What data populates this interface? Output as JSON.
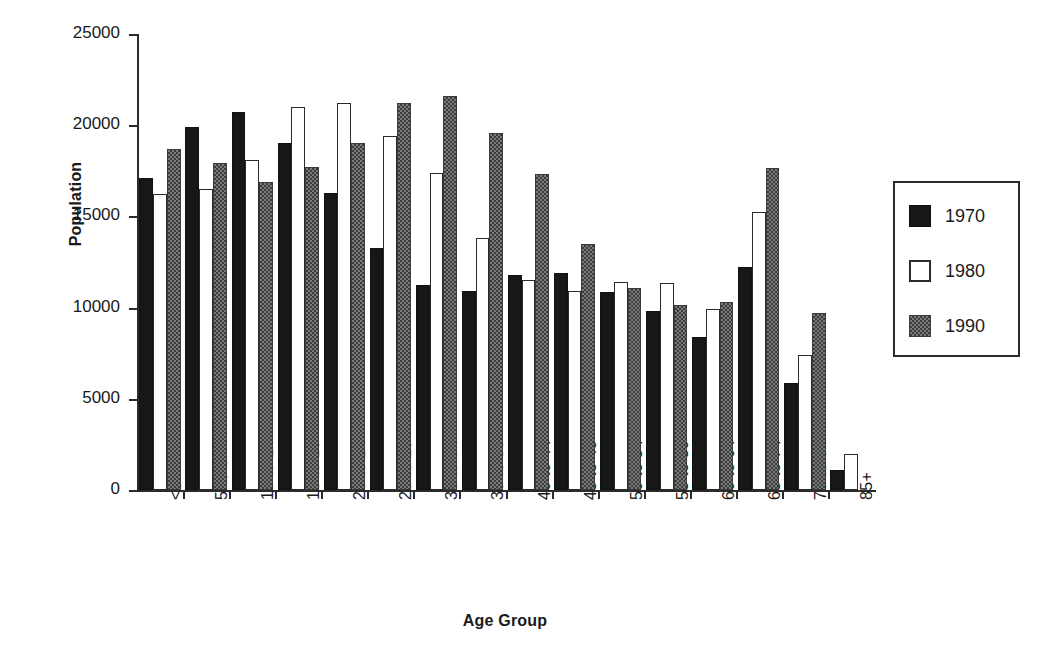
{
  "chart_data": {
    "type": "bar",
    "title": "",
    "xlabel": "Age Group",
    "ylabel": "Population",
    "ylim": [
      0,
      25000
    ],
    "ytick_values": [
      0,
      5000,
      10000,
      15000,
      20000,
      25000
    ],
    "ytick_labels": [
      "0",
      "5000",
      "10000",
      "15000",
      "20000",
      "25000"
    ],
    "grid": false,
    "legend_position": "right",
    "categories": [
      "<5",
      "5 to 9",
      "10 to 14",
      "15 to 19",
      "20 to 24",
      "25 to 29",
      "30 to 34",
      "35 to 39",
      "40 to 44",
      "45 to 49",
      "50 to 54",
      "55 to 59",
      "60 to 64",
      "65 to 74",
      "75 to 84",
      "85+"
    ],
    "series": [
      {
        "name": "1970",
        "color": "#171717",
        "values": [
          17100,
          19900,
          20700,
          19000,
          16300,
          13250,
          11250,
          10900,
          11800,
          11900,
          10850,
          9800,
          8400,
          12200,
          5850,
          1100
        ]
      },
      {
        "name": "1980",
        "color": "#ffffff",
        "values": [
          16250,
          16500,
          18100,
          21000,
          21200,
          19400,
          17400,
          13800,
          11500,
          10900,
          11400,
          11350,
          9900,
          15250,
          7400,
          2000
        ]
      },
      {
        "name": "1990",
        "color": "#7a7a7a",
        "values": [
          18700,
          17950,
          16900,
          17700,
          19000,
          21200,
          21600,
          19600,
          17350,
          13500,
          11050,
          10150,
          10300,
          17650,
          9700,
          null
        ]
      }
    ]
  },
  "legend": {
    "entries": [
      {
        "label": "1970",
        "swatch": "solid-black"
      },
      {
        "label": "1980",
        "swatch": "outline-white"
      },
      {
        "label": "1990",
        "swatch": "hatched-gray"
      }
    ]
  }
}
